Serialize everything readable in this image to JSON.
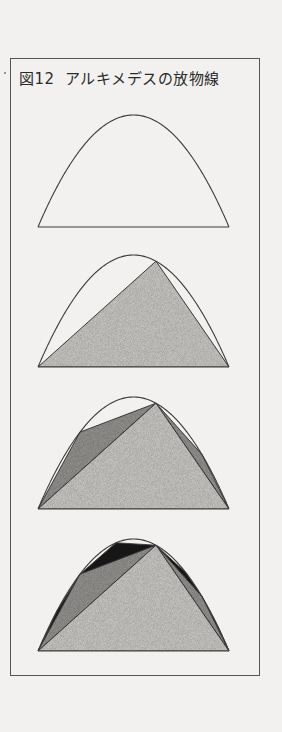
{
  "figure": {
    "label": "図12",
    "title": "アルキメデスの放物線",
    "colors": {
      "background": "#f2f1ef",
      "outline": "#3a3a3a",
      "stage1_fill": "#d4d2cf",
      "stage2_fill": "#9c9a97",
      "stage3_fill": "#161616"
    },
    "panels": [
      {
        "id": 1,
        "base_y": 227,
        "triangles": 0,
        "caption": "parabolic segment"
      },
      {
        "id": 2,
        "base_y": 367,
        "triangles": 1,
        "caption": "first inscribed triangle"
      },
      {
        "id": 3,
        "base_y": 509,
        "triangles": 3,
        "caption": "second-stage triangles added"
      },
      {
        "id": 4,
        "base_y": 651,
        "triangles": 7,
        "caption": "third-stage triangles added"
      }
    ]
  }
}
